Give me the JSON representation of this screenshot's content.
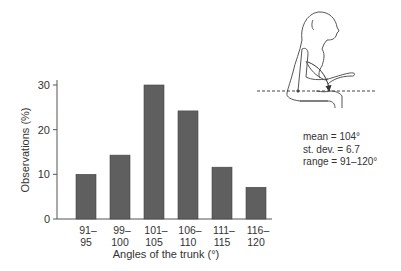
{
  "chart_data": {
    "type": "bar",
    "title": "",
    "xlabel": "Angles of the trunk (°)",
    "ylabel": "Observations (%)",
    "categories": [
      "91–95",
      "99–100",
      "101–105",
      "106–110",
      "111–115",
      "116–120"
    ],
    "category_lines": [
      [
        "91–",
        "95"
      ],
      [
        "99–",
        "100"
      ],
      [
        "101–",
        "105"
      ],
      [
        "106–",
        "110"
      ],
      [
        "111–",
        "115"
      ],
      [
        "116–",
        "120"
      ]
    ],
    "values": [
      10,
      14.3,
      30,
      24.2,
      11.6,
      7.1
    ],
    "ylim": [
      0,
      30
    ],
    "yticks": [
      0,
      10,
      20,
      30
    ],
    "grid": false,
    "legend": null,
    "bar_color": "#5f5f5f",
    "annotations": [
      "mean = 104°",
      "st. dev. = 6.7",
      "range = 91–120°"
    ]
  },
  "stats": {
    "mean": "mean = 104°",
    "sd": "st. dev. = 6.7",
    "range": "range = 91–120°"
  },
  "illustration": {
    "description": "seated person with trunk angle measured relative to horizontal dashed line"
  }
}
